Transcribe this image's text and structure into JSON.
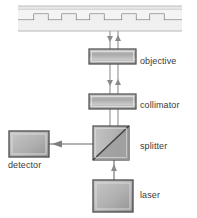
{
  "figure": {
    "width": 197,
    "height": 218,
    "background": "#ffffff"
  },
  "labels": {
    "objective": "objective",
    "collimator": "collimator",
    "splitter": "splitter",
    "laser": "laser",
    "detector": "detector"
  },
  "colors": {
    "outline": "#4a4a4a",
    "fill_light": "#f2f2f2",
    "fill_mid": "#b9b9b9",
    "fill_dark": "#8e8e8e",
    "beam": "#9a9a9a",
    "text": "#3a3a3a",
    "disc": "#e8e8e8"
  },
  "components": [
    {
      "name": "disc",
      "shape": "grooved-track",
      "x": 18,
      "y": 6,
      "w": 164,
      "h": 28
    },
    {
      "name": "objective",
      "shape": "lens-bar",
      "x": 89,
      "y": 49,
      "w": 47,
      "h": 15
    },
    {
      "name": "collimator",
      "shape": "lens-bar",
      "x": 89,
      "y": 94,
      "w": 47,
      "h": 15
    },
    {
      "name": "splitter",
      "shape": "cube-diagonal",
      "x": 93,
      "y": 126,
      "w": 36,
      "h": 34
    },
    {
      "name": "laser",
      "shape": "box",
      "x": 93,
      "y": 180,
      "w": 40,
      "h": 32
    },
    {
      "name": "detector",
      "shape": "box",
      "x": 9,
      "y": 131,
      "w": 40,
      "h": 26
    }
  ],
  "beams": [
    {
      "name": "beam-down-outgoing",
      "from": "splitter",
      "to": "disc",
      "direction": "up",
      "x": 110
    },
    {
      "name": "beam-up-returning",
      "from": "disc",
      "to": "splitter",
      "direction": "down",
      "x": 118
    },
    {
      "name": "beam-laser-up",
      "from": "laser",
      "to": "splitter",
      "direction": "up",
      "x": 114
    },
    {
      "name": "beam-to-detector",
      "from": "splitter",
      "to": "detector",
      "direction": "left",
      "y": 144
    }
  ]
}
